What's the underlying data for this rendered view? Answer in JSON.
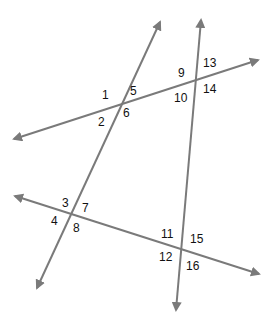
{
  "diagram": {
    "type": "transversals",
    "line_color": "#7a7a7a",
    "lines": [
      {
        "name": "line-a",
        "x1": 37,
        "y1": 288,
        "x2": 160,
        "y2": 22
      },
      {
        "name": "line-b",
        "x1": 176,
        "y1": 310,
        "x2": 201,
        "y2": 20
      },
      {
        "name": "line-top",
        "x1": 14,
        "y1": 139,
        "x2": 258,
        "y2": 60
      },
      {
        "name": "line-bottom",
        "x1": 15,
        "y1": 196,
        "x2": 259,
        "y2": 274
      }
    ],
    "labels": [
      {
        "text": "1",
        "x": 102,
        "y": 89
      },
      {
        "text": "5",
        "x": 130,
        "y": 85
      },
      {
        "text": "2",
        "x": 98,
        "y": 116
      },
      {
        "text": "6",
        "x": 123,
        "y": 107
      },
      {
        "text": "9",
        "x": 178,
        "y": 67
      },
      {
        "text": "13",
        "x": 203,
        "y": 57
      },
      {
        "text": "10",
        "x": 174,
        "y": 92
      },
      {
        "text": "14",
        "x": 203,
        "y": 83
      },
      {
        "text": "3",
        "x": 62,
        "y": 197
      },
      {
        "text": "7",
        "x": 82,
        "y": 202
      },
      {
        "text": "4",
        "x": 51,
        "y": 215
      },
      {
        "text": "8",
        "x": 73,
        "y": 222
      },
      {
        "text": "11",
        "x": 161,
        "y": 228
      },
      {
        "text": "15",
        "x": 190,
        "y": 233
      },
      {
        "text": "12",
        "x": 159,
        "y": 251
      },
      {
        "text": "16",
        "x": 186,
        "y": 260
      }
    ]
  }
}
